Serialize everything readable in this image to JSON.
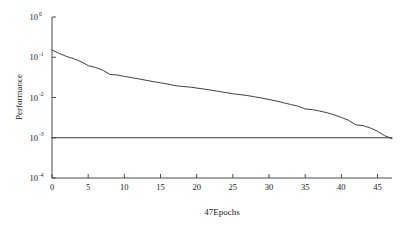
{
  "chart_data": {
    "type": "line",
    "title": "",
    "subtitle": "",
    "xlabel": "47Epochs",
    "ylabel": "Performance",
    "yscale": "log",
    "xscale": "linear",
    "xlim": [
      0,
      47
    ],
    "ylim": [
      0.0001,
      1
    ],
    "grid": false,
    "legend": false,
    "legend_position": "none",
    "xticks": [
      0,
      5,
      10,
      15,
      20,
      25,
      30,
      35,
      40,
      45
    ],
    "xtick_labels": [
      "0",
      "5",
      "10",
      "15",
      "20",
      "25",
      "30",
      "35",
      "40",
      "45"
    ],
    "yticks": [
      1,
      0.1,
      0.01,
      0.001,
      0.0001
    ],
    "ytick_labels": [
      "10⁰",
      "10⁻¹",
      "10⁻²",
      "10⁻³",
      "10⁻⁴"
    ],
    "ytick_mantissas": [
      "10",
      "10",
      "10",
      "10",
      "10"
    ],
    "ytick_exponents": [
      "0",
      "-1",
      "-2",
      "-3",
      "-4"
    ],
    "series": [
      {
        "name": "Train",
        "color": "#2b2b2b",
        "x": [
          0,
          1,
          2,
          3,
          4,
          5,
          6,
          7,
          8,
          9,
          10,
          11,
          12,
          13,
          14,
          15,
          16,
          17,
          18,
          19,
          20,
          21,
          22,
          23,
          24,
          25,
          26,
          27,
          28,
          29,
          30,
          31,
          32,
          33,
          34,
          35,
          36,
          37,
          38,
          39,
          40,
          41,
          42,
          43,
          44,
          45,
          46,
          47
        ],
        "values": [
          0.152,
          0.124,
          0.105,
          0.092,
          0.078,
          0.062,
          0.056,
          0.048,
          0.0375,
          0.0362,
          0.0335,
          0.0312,
          0.029,
          0.0268,
          0.0248,
          0.0232,
          0.0215,
          0.0198,
          0.0188,
          0.0182,
          0.0172,
          0.0162,
          0.0152,
          0.0142,
          0.0133,
          0.0124,
          0.0118,
          0.0112,
          0.0104,
          0.0097,
          0.0089,
          0.0082,
          0.0074,
          0.0067,
          0.0061,
          0.0052,
          0.005,
          0.0046,
          0.0042,
          0.0037,
          0.0032,
          0.0027,
          0.0021,
          0.002,
          0.00175,
          0.00145,
          0.00112,
          0.00095
        ]
      },
      {
        "name": "Goal",
        "color": "#2b2b2b",
        "x": [
          0,
          47
        ],
        "values": [
          0.001,
          0.001
        ]
      }
    ],
    "annotations": []
  }
}
